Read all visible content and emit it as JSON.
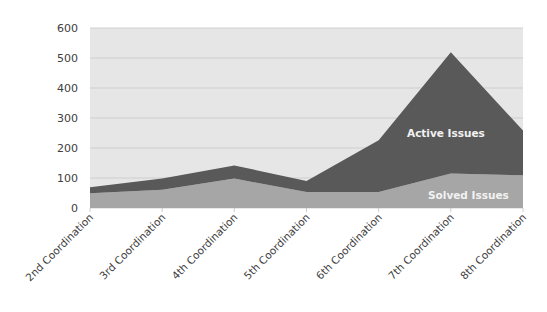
{
  "chart_data": {
    "type": "area",
    "stacked": true,
    "title": "",
    "xlabel": "",
    "ylabel": "",
    "categories": [
      "2nd Coordination",
      "3rd Coordination",
      "4th Coordination",
      "5th Coordination",
      "6th Coordination",
      "7th Coordination",
      "8th Coordination"
    ],
    "series": [
      {
        "name": "Solved Issues",
        "values": [
          49,
          61,
          98,
          53,
          53,
          115,
          109
        ],
        "color": "#a6a6a6"
      },
      {
        "name": "Active Issues",
        "values": [
          20,
          37,
          44,
          37,
          173,
          404,
          149
        ],
        "color": "#595959"
      }
    ],
    "totals": [
      69,
      98,
      142,
      90,
      226,
      519,
      258
    ],
    "ylim": [
      0,
      600
    ],
    "yticks": [
      0,
      100,
      200,
      300,
      400,
      500,
      600
    ],
    "grid": true,
    "legend": "none (series labels placed inside areas)",
    "annotations": [
      {
        "text": "Active Issues",
        "series": "Active Issues"
      },
      {
        "text": "Solved Issues",
        "series": "Solved Issues"
      }
    ],
    "plot_background": "#e6e6e6"
  },
  "labels": {
    "active": "Active Issues",
    "solved": "Solved Issues"
  }
}
